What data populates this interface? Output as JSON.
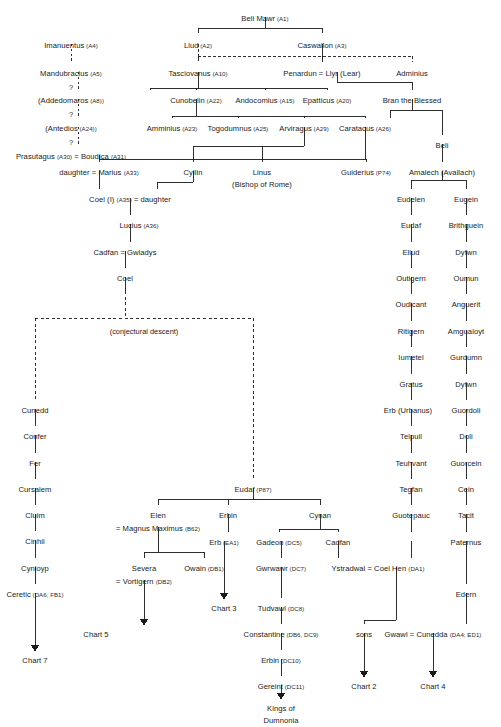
{
  "chart_data": {
    "type": "diagram",
    "diagram_kind": "family-tree",
    "legend": {
      "solid_line": "attested descent",
      "dashed_line": "conjectural or uncertain descent",
      "equals_sign": "marriage",
      "arrow": "continues on another chart"
    },
    "notes": [
      "(conjectural descent)"
    ]
  },
  "nodes": [
    {
      "id": "beli_mawr",
      "name": "Beli Mawr",
      "ref": "(A1)",
      "x": 265,
      "y": 14
    },
    {
      "id": "llud",
      "name": "Llud",
      "ref": "(A2)",
      "x": 198,
      "y": 41
    },
    {
      "id": "caswallon",
      "name": "Caswallon",
      "ref": "(A3)",
      "x": 322,
      "y": 41
    },
    {
      "id": "imanuentus",
      "name": "Imanuentus",
      "ref": "(A4)",
      "x": 71,
      "y": 41
    },
    {
      "id": "mandubracius",
      "name": "Mandubracius",
      "ref": "(A5)",
      "x": 71,
      "y": 69
    },
    {
      "id": "addedomaros",
      "name": "(Addedomaros",
      "ref": "(A8))",
      "x": 71,
      "y": 96
    },
    {
      "id": "antedios",
      "name": "(Antedios",
      "ref": "(A24))",
      "x": 71,
      "y": 124
    },
    {
      "id": "prasutagus_boudica",
      "name": "Prasutagus (A30) = Boudica (A31)",
      "ref": "",
      "x": 71,
      "y": 152,
      "composite": true,
      "parts": [
        {
          "t": "Prasutagus ",
          "k": "n"
        },
        {
          "t": "(A30)",
          "k": "r"
        },
        {
          "t": " = Boudica ",
          "k": "n"
        },
        {
          "t": "(A31)",
          "k": "r"
        }
      ]
    },
    {
      "id": "tasciovanus",
      "name": "Tasciovanus",
      "ref": "(A10)",
      "x": 198,
      "y": 69
    },
    {
      "id": "penardun_llyr",
      "name": "Penardun = Llyr (Lear)",
      "ref": "",
      "x": 322,
      "y": 69
    },
    {
      "id": "adminius",
      "name": "Adminius",
      "ref": "",
      "x": 412,
      "y": 69
    },
    {
      "id": "cunobelin",
      "name": "Cunobelin",
      "ref": "(A22)",
      "x": 196,
      "y": 96
    },
    {
      "id": "andocomius",
      "name": "Andocomius",
      "ref": "(A15)",
      "x": 265,
      "y": 96
    },
    {
      "id": "epatticus",
      "name": "Epatticus",
      "ref": "(A20)",
      "x": 327,
      "y": 96
    },
    {
      "id": "bran",
      "name": "Bran the Blessed",
      "ref": "",
      "x": 412,
      "y": 96
    },
    {
      "id": "amminius",
      "name": "Amminius",
      "ref": "(A23)",
      "x": 172,
      "y": 124
    },
    {
      "id": "togodumnus",
      "name": "Togodumnus",
      "ref": "(A25)",
      "x": 238,
      "y": 124
    },
    {
      "id": "arviragus",
      "name": "Arviragus",
      "ref": "(A29)",
      "x": 304,
      "y": 124
    },
    {
      "id": "caratacus",
      "name": "Caratacus",
      "ref": "(A26)",
      "x": 365,
      "y": 124
    },
    {
      "id": "beli",
      "name": "Beli",
      "ref": "",
      "x": 442,
      "y": 141
    },
    {
      "id": "daughter_marius",
      "name": "daughter = Marius (A33)",
      "ref": "",
      "x": 99,
      "y": 168,
      "parts": [
        {
          "t": "daughter = Marius ",
          "k": "n"
        },
        {
          "t": "(A33)",
          "k": "r"
        }
      ]
    },
    {
      "id": "cyllin",
      "name": "Cyllin",
      "ref": "",
      "x": 193,
      "y": 168
    },
    {
      "id": "linus",
      "name": "Linus",
      "ref": "",
      "x": 262,
      "y": 168
    },
    {
      "id": "bishop_rome",
      "name": "(Bishop of Rome)",
      "ref": "",
      "x": 262,
      "y": 180
    },
    {
      "id": "guiderius",
      "name": "Guiderius",
      "ref": "(P74)",
      "x": 366,
      "y": 168
    },
    {
      "id": "amalech",
      "name": "Amalech (Avallach)",
      "ref": "",
      "x": 442,
      "y": 168
    },
    {
      "id": "coel_i",
      "name": "Coel (I) (A35) = daughter",
      "ref": "",
      "x": 130,
      "y": 195,
      "parts": [
        {
          "t": "Coel (I) ",
          "k": "n"
        },
        {
          "t": "(A35)",
          "k": "r"
        },
        {
          "t": " = daughter",
          "k": "n"
        }
      ]
    },
    {
      "id": "eudelen",
      "name": "Eudelen",
      "ref": "",
      "x": 411,
      "y": 195
    },
    {
      "id": "eugein",
      "name": "Eugein",
      "ref": "",
      "x": 466,
      "y": 195
    },
    {
      "id": "lucius",
      "name": "Lucius",
      "ref": "(A36)",
      "x": 139,
      "y": 221
    },
    {
      "id": "eudaf_r",
      "name": "Eudaf",
      "ref": "",
      "x": 411,
      "y": 221
    },
    {
      "id": "brithguein",
      "name": "Brithguein",
      "ref": "",
      "x": 466,
      "y": 221
    },
    {
      "id": "cadfan_gwladys",
      "name": "Cadfan = Gwladys",
      "ref": "",
      "x": 125,
      "y": 248
    },
    {
      "id": "eliud",
      "name": "Eliud",
      "ref": "",
      "x": 411,
      "y": 248
    },
    {
      "id": "dyfwn1",
      "name": "Dyfwn",
      "ref": "",
      "x": 466,
      "y": 248
    },
    {
      "id": "coel",
      "name": "Coel",
      "ref": "",
      "x": 125,
      "y": 274
    },
    {
      "id": "outigern",
      "name": "Outigern",
      "ref": "",
      "x": 411,
      "y": 274
    },
    {
      "id": "oumun",
      "name": "Oumun",
      "ref": "",
      "x": 466,
      "y": 274
    },
    {
      "id": "oudicant",
      "name": "Oudicant",
      "ref": "",
      "x": 411,
      "y": 300
    },
    {
      "id": "anguerit",
      "name": "Anguerit",
      "ref": "",
      "x": 466,
      "y": 300
    },
    {
      "id": "ritigern",
      "name": "Ritigern",
      "ref": "",
      "x": 411,
      "y": 327
    },
    {
      "id": "amgualoyt",
      "name": "Amgualoyt",
      "ref": "",
      "x": 466,
      "y": 327
    },
    {
      "id": "iumetel",
      "name": "Iumetel",
      "ref": "",
      "x": 411,
      "y": 353
    },
    {
      "id": "gurdumn",
      "name": "Gurdumn",
      "ref": "",
      "x": 466,
      "y": 353
    },
    {
      "id": "gratus",
      "name": "Gratus",
      "ref": "",
      "x": 411,
      "y": 380
    },
    {
      "id": "dyfwn2",
      "name": "Dyfwn",
      "ref": "",
      "x": 466,
      "y": 380
    },
    {
      "id": "cunedd",
      "name": "Cunedd",
      "ref": "",
      "x": 35,
      "y": 406
    },
    {
      "id": "erb_urbanus",
      "name": "Erb (Urbanus)",
      "ref": "",
      "x": 408,
      "y": 406
    },
    {
      "id": "guordoli",
      "name": "Guordoli",
      "ref": "",
      "x": 466,
      "y": 406
    },
    {
      "id": "confer",
      "name": "Confer",
      "ref": "",
      "x": 35,
      "y": 432
    },
    {
      "id": "telpuil",
      "name": "Telpuil",
      "ref": "",
      "x": 411,
      "y": 432
    },
    {
      "id": "doli",
      "name": "Doli",
      "ref": "",
      "x": 466,
      "y": 432
    },
    {
      "id": "fer",
      "name": "Fer",
      "ref": "",
      "x": 35,
      "y": 459
    },
    {
      "id": "teuhvant",
      "name": "Teuhvant",
      "ref": "",
      "x": 411,
      "y": 459
    },
    {
      "id": "guorcein",
      "name": "Guorcein",
      "ref": "",
      "x": 466,
      "y": 459
    },
    {
      "id": "cursalem",
      "name": "Cursalem",
      "ref": "",
      "x": 35,
      "y": 485
    },
    {
      "id": "eudaf_p87",
      "name": "Eudaf",
      "ref": "(P87)",
      "x": 253,
      "y": 485
    },
    {
      "id": "tegfan",
      "name": "Tegfan",
      "ref": "",
      "x": 411,
      "y": 485
    },
    {
      "id": "cein",
      "name": "Cein",
      "ref": "",
      "x": 466,
      "y": 485
    },
    {
      "id": "cluim",
      "name": "Cluim",
      "ref": "",
      "x": 35,
      "y": 511
    },
    {
      "id": "elen",
      "name": "Elen",
      "ref": "",
      "x": 158,
      "y": 511
    },
    {
      "id": "erbin",
      "name": "Erbin",
      "ref": "",
      "x": 228,
      "y": 511
    },
    {
      "id": "cynan",
      "name": "Cynan",
      "ref": "",
      "x": 320,
      "y": 511
    },
    {
      "id": "guotepauc",
      "name": "Guotepauc",
      "ref": "",
      "x": 411,
      "y": 511
    },
    {
      "id": "tacit",
      "name": "Tacit",
      "ref": "",
      "x": 466,
      "y": 511
    },
    {
      "id": "magnus_maximus",
      "name": "= Magnus Maximus (B62)",
      "ref": "",
      "x": 158,
      "y": 524,
      "parts": [
        {
          "t": "= Magnus Maximus ",
          "k": "n"
        },
        {
          "t": "(B62)",
          "k": "r"
        }
      ]
    },
    {
      "id": "cinhil",
      "name": "Cinhil",
      "ref": "",
      "x": 35,
      "y": 537
    },
    {
      "id": "erb_ea1",
      "name": "Erb",
      "ref": "(EA1)",
      "x": 224,
      "y": 538
    },
    {
      "id": "gadeon",
      "name": "Gadeon",
      "ref": "(DC5)",
      "x": 279,
      "y": 538
    },
    {
      "id": "cadfan2",
      "name": "Cadfan",
      "ref": "",
      "x": 338,
      "y": 538
    },
    {
      "id": "paternus",
      "name": "Paternus",
      "ref": "",
      "x": 466,
      "y": 538
    },
    {
      "id": "cynloyp",
      "name": "Cynloyp",
      "ref": "",
      "x": 35,
      "y": 564
    },
    {
      "id": "severa",
      "name": "Severa",
      "ref": "",
      "x": 144,
      "y": 564
    },
    {
      "id": "owain",
      "name": "Owain",
      "ref": "(DB1)",
      "x": 204,
      "y": 564
    },
    {
      "id": "gwrwawr",
      "name": "Gwrwawr",
      "ref": "(DC7)",
      "x": 281,
      "y": 564
    },
    {
      "id": "ystradwal_coelhen",
      "name": "Ystradwal = Coel Hen (DA1)",
      "ref": "",
      "x": 378,
      "y": 564,
      "parts": [
        {
          "t": "Ystradwal = Coel Hen ",
          "k": "n"
        },
        {
          "t": "(DA1)",
          "k": "r"
        }
      ]
    },
    {
      "id": "vortigern",
      "name": "= Vortigern (DB2)",
      "ref": "",
      "x": 144,
      "y": 577,
      "parts": [
        {
          "t": "= Vortigern ",
          "k": "n"
        },
        {
          "t": "(DB2)",
          "k": "r"
        }
      ]
    },
    {
      "id": "ceretic",
      "name": "Ceretic",
      "ref": "(DA6; FB1)",
      "x": 35,
      "y": 590
    },
    {
      "id": "edern",
      "name": "Edern",
      "ref": "",
      "x": 466,
      "y": 590
    },
    {
      "id": "tudvawl",
      "name": "Tudvawl",
      "ref": "(DC8)",
      "x": 281,
      "y": 604
    },
    {
      "id": "chart3",
      "name": "Chart 3",
      "ref": "",
      "x": 224,
      "y": 604
    },
    {
      "id": "constantine",
      "name": "Constantine",
      "ref": "(DB6, DC9)",
      "x": 281,
      "y": 630
    },
    {
      "id": "sons",
      "name": "sons",
      "ref": "",
      "x": 364,
      "y": 630
    },
    {
      "id": "gwawl_cunedda",
      "name": "Gwawl = Cunedda (DA4; ED1)",
      "ref": "",
      "x": 433,
      "y": 630,
      "parts": [
        {
          "t": "Gwawl = Cunedda ",
          "k": "n"
        },
        {
          "t": "(DA4; ED1)",
          "k": "r"
        }
      ]
    },
    {
      "id": "chart5",
      "name": "Chart 5",
      "ref": "",
      "x": 96,
      "y": 630
    },
    {
      "id": "chart7",
      "name": "Chart 7",
      "ref": "",
      "x": 35,
      "y": 656
    },
    {
      "id": "erbin_dc10",
      "name": "Erbin",
      "ref": "(DC10)",
      "x": 281,
      "y": 656
    },
    {
      "id": "gereint",
      "name": "Gereint",
      "ref": "(DC11)",
      "x": 281,
      "y": 682
    },
    {
      "id": "chart2",
      "name": "Chart 2",
      "ref": "",
      "x": 364,
      "y": 682
    },
    {
      "id": "chart4",
      "name": "Chart 4",
      "ref": "",
      "x": 433,
      "y": 682
    },
    {
      "id": "kings_dumnonia_1",
      "name": "Kings of",
      "ref": "",
      "x": 281,
      "y": 704
    },
    {
      "id": "kings_dumnonia_2",
      "name": "Dumnonia",
      "ref": "",
      "x": 281,
      "y": 716
    }
  ],
  "questions": [
    {
      "id": "q1",
      "label": "?",
      "x": 71,
      "y": 83
    },
    {
      "id": "q2",
      "label": "?",
      "x": 71,
      "y": 110
    },
    {
      "id": "q3",
      "label": "?",
      "x": 71,
      "y": 138
    }
  ],
  "captions": [
    {
      "id": "conjectural",
      "label": "(conjectural descent)",
      "x": 144,
      "y": 327
    }
  ]
}
